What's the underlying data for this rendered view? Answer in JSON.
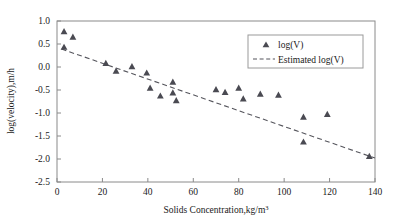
{
  "chart_data": {
    "type": "scatter",
    "title": "",
    "xlabel": "Solids Concentration,kg/m",
    "xlabel_sup": "3",
    "ylabel": "log(velocity),m/h",
    "xlim": [
      0,
      140
    ],
    "ylim": [
      -2.5,
      1.0
    ],
    "xticks": [
      0,
      20,
      40,
      60,
      80,
      100,
      120,
      140
    ],
    "yticks": [
      1.0,
      0.5,
      0.0,
      -0.5,
      -1.0,
      -1.5,
      -2.0,
      -2.5
    ],
    "xtick_labels": [
      "0",
      "20",
      "40",
      "60",
      "80",
      "100",
      "120",
      "140"
    ],
    "ytick_labels": [
      "1.0",
      "0.5",
      "0.0",
      "-0.5",
      "-1.0",
      "-1.5",
      "-2.0",
      "-2.5"
    ],
    "grid": false,
    "legend_position": "upper right",
    "series": [
      {
        "name": "log(V)",
        "type": "scatter",
        "marker": "triangle",
        "color": "#4a4a52",
        "points": [
          [
            3.1,
            0.78
          ],
          [
            3.1,
            0.44
          ],
          [
            7.0,
            0.66
          ],
          [
            21.5,
            0.09
          ],
          [
            26.0,
            -0.08
          ],
          [
            33.0,
            0.02
          ],
          [
            39.5,
            -0.12
          ],
          [
            41.0,
            -0.45
          ],
          [
            45.5,
            -0.62
          ],
          [
            51.0,
            -0.55
          ],
          [
            52.5,
            -0.72
          ],
          [
            51.0,
            -0.32
          ],
          [
            70.0,
            -0.48
          ],
          [
            74.0,
            -0.54
          ],
          [
            80.0,
            -0.45
          ],
          [
            82.0,
            -0.68
          ],
          [
            89.5,
            -0.58
          ],
          [
            97.5,
            -0.6
          ],
          [
            108.5,
            -1.08
          ],
          [
            108.5,
            -1.62
          ],
          [
            119.0,
            -1.02
          ],
          [
            137.5,
            -1.93
          ]
        ]
      },
      {
        "name": "Estimated log(V)",
        "type": "line",
        "style": "dashed",
        "color": "#55555c",
        "x": [
          2.0,
          140.0
        ],
        "y": [
          0.39,
          -1.98
        ]
      }
    ],
    "legend": [
      {
        "label": "log(V)",
        "marker": "triangle"
      },
      {
        "label": "Estimated log(V)",
        "marker": "dashed-line"
      }
    ]
  }
}
